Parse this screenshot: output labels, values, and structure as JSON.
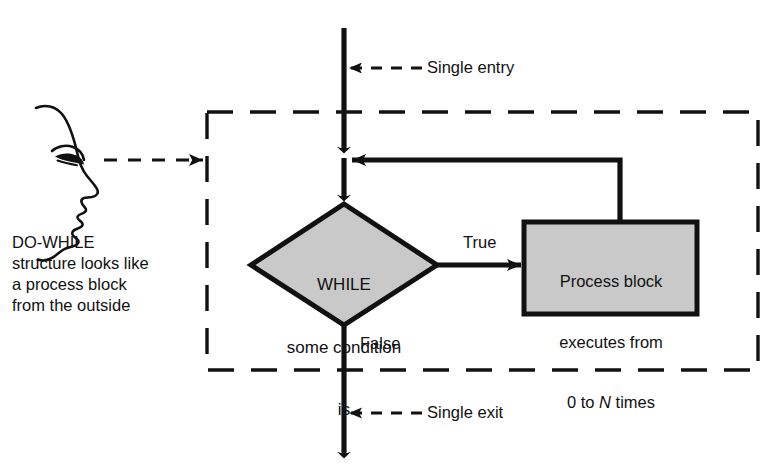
{
  "diagram": {
    "title": "DO-WHILE structure",
    "caption": {
      "lines": [
        "DO-WHILE",
        "structure looks like",
        "a process block",
        "from the outside"
      ]
    },
    "annotations": {
      "single_entry": "Single entry",
      "single_exit": "Single exit"
    },
    "branch_labels": {
      "true": "True",
      "false": "False"
    },
    "decision": {
      "shape": "diamond",
      "lines": [
        "WHILE",
        "some condition",
        "is"
      ]
    },
    "process": {
      "shape": "rectangle",
      "lines_pre": [
        "Process block",
        "executes from"
      ],
      "last_line_prefix": "0 to ",
      "last_line_italic": "N",
      "last_line_suffix": " times"
    },
    "boundary": {
      "style": "dashed",
      "meaning": "black-box outline of the DO-WHILE structure"
    },
    "observer": {
      "icon": "face-profile-icon",
      "sightline": "dashed-arrow-icon"
    },
    "colors": {
      "shape_fill": "#c9c9c9",
      "stroke": "#111111",
      "background": "#ffffff",
      "text": "#111111"
    }
  }
}
